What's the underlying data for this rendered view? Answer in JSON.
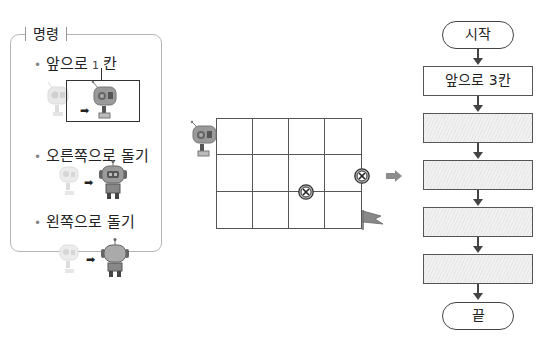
{
  "commands": {
    "title": "명령",
    "items": [
      {
        "label": "앞으로",
        "number": "1",
        "suffix": "칸"
      },
      {
        "label": "오른쪽으로 돌기"
      },
      {
        "label": "왼쪽으로 돌기"
      }
    ],
    "bullet": "•",
    "arrow": "➡"
  },
  "grid": {
    "rows": 3,
    "cols": 4,
    "obstacle_icon": "obstacle-x-icon",
    "goal_icon": "flag-icon",
    "robot_icon": "robot-icon"
  },
  "flowchart": {
    "start": "시작",
    "steps": [
      "앞으로 3칸",
      "",
      "",
      "",
      ""
    ],
    "end": "끝"
  },
  "colors": {
    "line": "#444444",
    "robot_body": "#8a8a8a",
    "robot_faded": "#d8d8d8",
    "arrow_gray": "#8c8c8c",
    "blank_fill": "#ececec"
  }
}
